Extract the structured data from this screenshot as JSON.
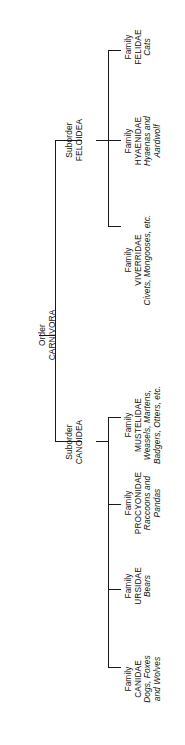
{
  "diagram": {
    "type": "taxonomic-tree",
    "subject": "Order Carnivora",
    "orientation": "rotated-90-ccw",
    "line_color": "#1a1a1a",
    "background_color": "#ffffff",
    "root": {
      "rank": "Order",
      "name": "CARNIVORA",
      "common": "",
      "common2": ""
    },
    "suborders": [
      {
        "rank": "Suborder",
        "name": "FELOIDEA",
        "common": "",
        "common2": ""
      },
      {
        "rank": "Suborder",
        "name": "CANOIDEA",
        "common": "",
        "common2": ""
      }
    ],
    "families": [
      {
        "rank": "Family",
        "name": "FELIDAE",
        "common": "Cats",
        "common2": "",
        "parent": "FELOIDEA"
      },
      {
        "rank": "Family",
        "name": "HYAENIDAE",
        "common": "Hyaenas and",
        "common2": "Aardwolf",
        "parent": "FELOIDEA"
      },
      {
        "rank": "Family",
        "name": "VIVERRIDAE",
        "common": "Civets, Mongooses, etc.",
        "common2": "",
        "parent": "FELOIDEA"
      },
      {
        "rank": "Family",
        "name": "MUSTELIDAE",
        "common": "Weasels, Martens,",
        "common2": "Badgers, Otters, etc.",
        "parent": "CANOIDEA"
      },
      {
        "rank": "Family",
        "name": "PROCYONIDAE",
        "common": "Raccoons and",
        "common2": "Pandas",
        "parent": "CANOIDEA"
      },
      {
        "rank": "Family",
        "name": "URSIDAE",
        "common": "Bears",
        "common2": "",
        "parent": "CANOIDEA"
      },
      {
        "rank": "Family",
        "name": "CANIDAE",
        "common": "Dogs, Foxes",
        "common2": "and Wolves",
        "parent": "CANOIDEA"
      }
    ]
  }
}
